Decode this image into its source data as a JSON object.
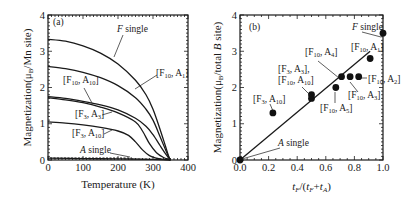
{
  "chart_data": [
    {
      "panel": "(a)",
      "type": "line",
      "xlabel": "Temperature (K)",
      "ylabel": "Magnetization(μB/Mn site)",
      "xlim": [
        0,
        400
      ],
      "ylim": [
        0,
        4
      ],
      "xticks": [
        "0",
        "100",
        "200",
        "300",
        "400"
      ],
      "yticks": [
        "0",
        "1",
        "2",
        "3",
        "4"
      ],
      "series": [
        {
          "name": "F single",
          "x": [
            0,
            50,
            100,
            150,
            200,
            250,
            280,
            300,
            320,
            335,
            345,
            350
          ],
          "values": [
            3.33,
            3.28,
            3.15,
            2.95,
            2.65,
            2.2,
            1.8,
            1.4,
            0.85,
            0.4,
            0.1,
            0.0
          ]
        },
        {
          "name": "[F10, A1]",
          "x": [
            0,
            50,
            100,
            150,
            200,
            250,
            280,
            300,
            320,
            335,
            345,
            350
          ],
          "values": [
            2.58,
            2.52,
            2.42,
            2.27,
            2.05,
            1.72,
            1.4,
            1.1,
            0.65,
            0.3,
            0.08,
            0.0
          ]
        },
        {
          "name": "[F10, A10]",
          "x": [
            0,
            50,
            100,
            150,
            200,
            250,
            280,
            300,
            320,
            335,
            345,
            350
          ],
          "values": [
            1.75,
            1.7,
            1.62,
            1.52,
            1.38,
            1.15,
            0.93,
            0.7,
            0.4,
            0.18,
            0.05,
            0.0
          ]
        },
        {
          "name": "[F3, A3]",
          "x": [
            0,
            50,
            100,
            150,
            200,
            250,
            270,
            290,
            310,
            330,
            345,
            350
          ],
          "values": [
            1.72,
            1.66,
            1.58,
            1.46,
            1.3,
            1.05,
            0.8,
            0.45,
            0.2,
            0.07,
            0.02,
            0.0
          ]
        },
        {
          "name": "[F3, A10]",
          "x": [
            0,
            50,
            100,
            150,
            200,
            230,
            250,
            270,
            290,
            310,
            330,
            350
          ],
          "values": [
            1.05,
            1.02,
            0.97,
            0.9,
            0.8,
            0.68,
            0.5,
            0.28,
            0.12,
            0.05,
            0.02,
            0.0
          ]
        },
        {
          "name": "A single",
          "x": [
            0,
            100,
            200,
            300,
            350
          ],
          "values": [
            0.05,
            0.04,
            0.03,
            0.02,
            0.0
          ]
        }
      ],
      "annotations": [
        "(a)",
        "F single",
        "[F10, A1]",
        "[F10, A10]",
        "[F3, A3]",
        "[F3, A10]",
        "A single"
      ]
    },
    {
      "panel": "(b)",
      "type": "scatter",
      "xlabel": "tF/(tF+tA)",
      "ylabel": "Magnetization(μB/total B site)",
      "xlim": [
        0,
        1.0
      ],
      "ylim": [
        0,
        4
      ],
      "xticks": [
        "0.0",
        "0.2",
        "0.4",
        "0.6",
        "0.8",
        "1.0"
      ],
      "yticks": [
        "0",
        "1",
        "2",
        "3",
        "4"
      ],
      "points": [
        {
          "label": "A single",
          "x": 0.0,
          "y": 0.0
        },
        {
          "label": "[F3, A10]",
          "x": 0.23,
          "y": 1.3
        },
        {
          "label": "[F3, A3]",
          "x": 0.5,
          "y": 1.8
        },
        {
          "label": "[F10, A10]",
          "x": 0.5,
          "y": 1.7
        },
        {
          "label": "[F10, A5]",
          "x": 0.67,
          "y": 2.0
        },
        {
          "label": "[F10, A4]",
          "x": 0.71,
          "y": 2.3
        },
        {
          "label": "[F10, A3]",
          "x": 0.77,
          "y": 2.3
        },
        {
          "label": "[F10, A2]",
          "x": 0.83,
          "y": 2.3
        },
        {
          "label": "[F10, A1]",
          "x": 0.91,
          "y": 2.8
        },
        {
          "label": "F single",
          "x": 1.0,
          "y": 3.5
        }
      ],
      "fit_line": {
        "x": [
          0.0,
          0.91
        ],
        "y": [
          0.0,
          3.0
        ]
      },
      "annotations": [
        "(b)",
        "F single",
        "[F10, A1]",
        "[F10, A4]",
        "[F3, A3],",
        "[F10, A10]",
        "[F10, A2]",
        "[F10, A3]",
        "[F10, A5]",
        "[F3, A10]",
        "A single"
      ]
    }
  ],
  "panel_a": {
    "label": "(a)",
    "xlabel": "Temperature (K)",
    "ylabel": "Magnetization(μB/Mn site)",
    "xticks": [
      "0",
      "100",
      "200",
      "300",
      "400"
    ],
    "yticks": [
      "0",
      "1",
      "2",
      "3",
      "4"
    ]
  },
  "panel_b": {
    "label": "(b)",
    "ylabel": "Magnetization(μB/total B site)",
    "xticks": [
      "0.0",
      "0.2",
      "0.4",
      "0.6",
      "0.8",
      "1.0"
    ],
    "yticks": [
      "0",
      "1",
      "2",
      "3",
      "4"
    ]
  }
}
